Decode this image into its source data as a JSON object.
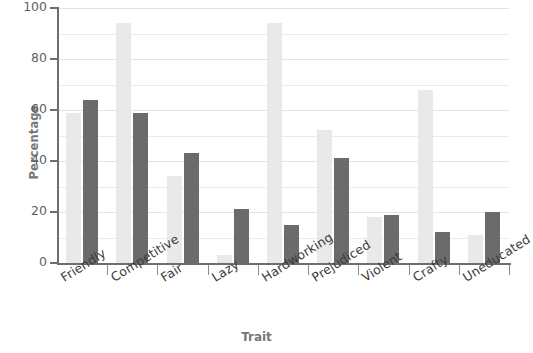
{
  "chart_data": {
    "type": "bar",
    "title": "",
    "xlabel": "Trait",
    "ylabel": "Percentage",
    "ylim": [
      0,
      100
    ],
    "yticks": [
      0,
      20,
      40,
      60,
      80,
      100
    ],
    "ytick_labels": [
      "0",
      "20",
      "40",
      "60",
      "80",
      "100"
    ],
    "gridlines": [
      0,
      10,
      20,
      30,
      40,
      50,
      60,
      70,
      80,
      90,
      100
    ],
    "grid": true,
    "legend": "none",
    "categories": [
      "Friendly",
      "Competitive",
      "Fair",
      "Lazy",
      "Hardworking",
      "Prejudiced",
      "Violent",
      "Crafty",
      "Uneducated"
    ],
    "series": [
      {
        "name": "series-light",
        "color": "#e9e9e9",
        "values": [
          59,
          94,
          34,
          3,
          94,
          52,
          18,
          68,
          11
        ]
      },
      {
        "name": "series-dark",
        "color": "#6b6b6b",
        "values": [
          64,
          59,
          43,
          21,
          15,
          41,
          19,
          12,
          20
        ]
      }
    ]
  },
  "axis": {
    "y_title": "Percentage",
    "x_title": "Trait",
    "axis_color": "#6e6e6e",
    "label_color": "#777777"
  }
}
